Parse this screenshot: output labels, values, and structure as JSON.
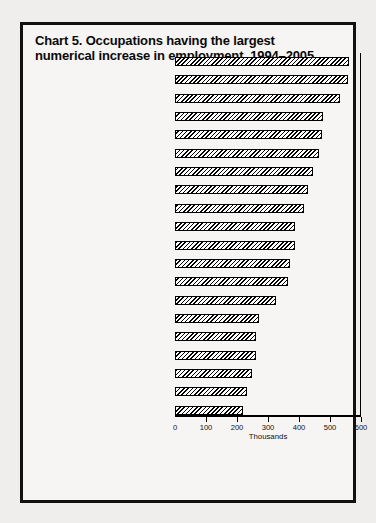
{
  "chart_data": {
    "type": "bar",
    "orientation": "horizontal",
    "title": "Chart 5.  Occupations having the largest numerical increase in employment, 1994–2005",
    "title_line1": "Chart 5.  Occupations having the largest",
    "title_line2": "numerical increase in employment, 1994–2005",
    "xlabel": "Thousands",
    "ylabel": "",
    "xlim": [
      0,
      600
    ],
    "xticks": [
      0,
      100,
      200,
      300,
      400,
      500,
      600
    ],
    "xtick_labels": [
      "0",
      "100",
      "200",
      "300",
      "400",
      "500",
      "600"
    ],
    "grid": false,
    "legend": "none",
    "bar_fill": "diagonal-hatch",
    "bar_edge_color": "#000000",
    "background_color": "#f6f5f3",
    "categories": [
      "Cashiers",
      "Janitors and cleaners",
      "Salespersons, retail",
      "Waiters and waitresses",
      "Registered nurses",
      "General managers and top executives",
      "Systems analysts",
      "Home health aides",
      "Guards",
      "Nursing aides, orderlies, and attendants",
      "Teachers, secondary school",
      "Marketing and sales worker supervisors",
      "Teacher aides and educational assistants",
      "Receptionists and information clerks",
      "Truck drivers, light and heavy",
      "Secretaries, except legal and medical",
      "Clerical supervisors and managers",
      "Child-care workers",
      "Maintenance repairers, general utility",
      "Teachers, elementary school"
    ],
    "category_lines": [
      [
        "Cashiers"
      ],
      [
        "Janitors and cleaners"
      ],
      [
        "Salespersons, retail"
      ],
      [
        "Waiters and waitresses"
      ],
      [
        "Registered nurses"
      ],
      [
        "General managers and",
        "top executives"
      ],
      [
        "Systems analysts"
      ],
      [
        "Home health aides"
      ],
      [
        "Guards"
      ],
      [
        "Nursing aides, orderlies, and",
        "attendants"
      ],
      [
        "Teachers, secondary school"
      ],
      [
        "Marketing and sales worker",
        "supervisors"
      ],
      [
        "Teacher aides and",
        "educational assistants"
      ],
      [
        "Receptionists and",
        "information clerks"
      ],
      [
        "Truck drivers, light and heavy"
      ],
      [
        "Secretaries, except legal and",
        "medical"
      ],
      [
        "Clerical supervisors and",
        "managers"
      ],
      [
        "Child-care workers"
      ],
      [
        "Maintenance repairers,",
        "general utility"
      ],
      [
        "Teachers, elementary school"
      ]
    ],
    "values": [
      562,
      559,
      532,
      479,
      473,
      466,
      445,
      428,
      415,
      387,
      387,
      370,
      364,
      325,
      271,
      262,
      261,
      248,
      231,
      220
    ],
    "units": "thousands"
  }
}
